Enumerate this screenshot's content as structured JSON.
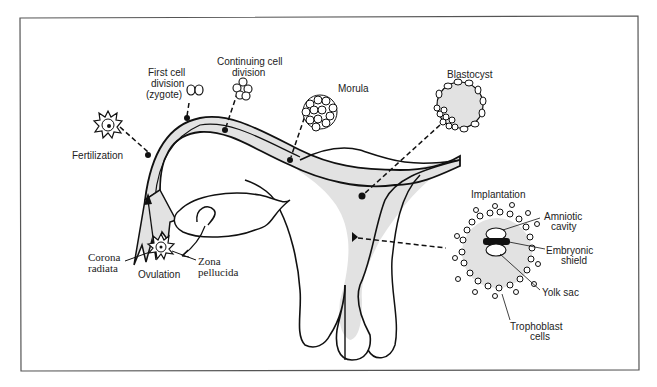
{
  "diagram": {
    "colors": {
      "stroke": "#111111",
      "fill": "#dddddd",
      "border": "#555555",
      "background": "#ffffff"
    },
    "labels": {
      "fertilization": "Fertilization",
      "first_cell_1": "First cell",
      "first_cell_2": "division",
      "first_cell_3": "(zygote)",
      "continuing_1": "Continuing cell",
      "continuing_2": "division",
      "morula": "Morula",
      "blastocyst": "Blastocyst",
      "implantation": "Implantation",
      "amniotic_1": "Amniotic",
      "amniotic_2": "cavity",
      "embryonic_1": "Embryonic",
      "embryonic_2": "shield",
      "yolk_sac": "Yolk sac",
      "trophoblast_1": "Trophoblast",
      "trophoblast_2": "cells",
      "corona_1": "Corona",
      "corona_2": "radiata",
      "ovulation": "Ovulation",
      "zona_1": "Zona",
      "zona_2": "pellucida"
    }
  }
}
